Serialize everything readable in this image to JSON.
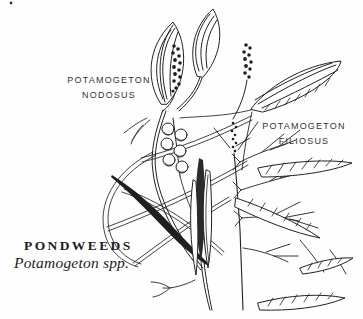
{
  "figure": {
    "background_color": "#fefefe",
    "ink_color": "#222222"
  },
  "labels": {
    "nodosus": {
      "line1": "POTAMOGETON",
      "line2": "NODOSUS"
    },
    "filiosus": {
      "line1": "POTAMOGETON",
      "line2": "FILIOSUS"
    },
    "caption_title": "PONDWEEDS",
    "caption_subtitle": "Potamogeton spp."
  }
}
